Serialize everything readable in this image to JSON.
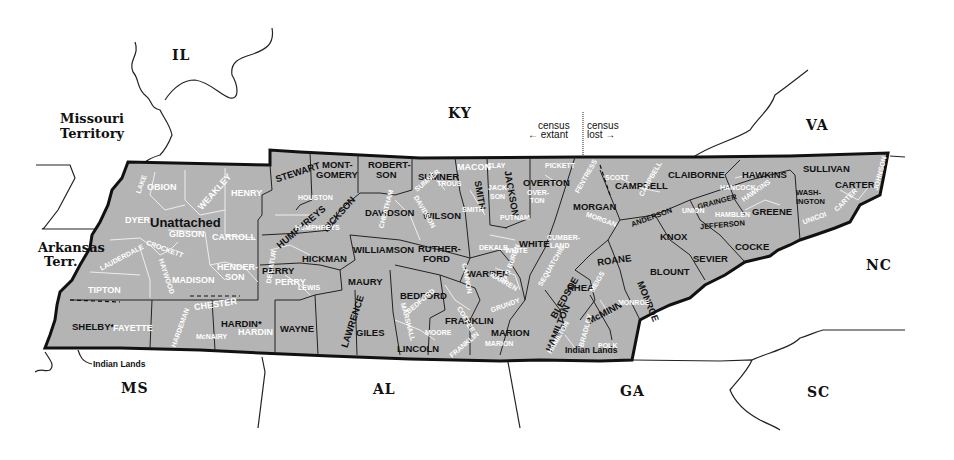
{
  "map": {
    "subject": "Tennessee counties (census map)",
    "neighbors": {
      "il": "IL",
      "missouri_1": "Missouri",
      "missouri_2": "Territory",
      "arkansas_1": "Arkansas",
      "arkansas_2": "Terr.",
      "ky": "KY",
      "va": "VA",
      "nc": "NC",
      "sc": "SC",
      "ga": "GA",
      "al": "AL",
      "ms": "MS"
    },
    "legend": {
      "left_line1": "census",
      "left_line2": "← extant",
      "right_line1": "census",
      "right_line2": "lost →"
    },
    "annotations": {
      "unattached": "Unattached",
      "indian_lands_west": "Indian Lands",
      "indian_lands_east": "Indian Lands"
    },
    "colors": {
      "state_fill": "#b4b4b4",
      "border": "#111111",
      "modern_label": "#ffffff",
      "background": "#ffffff"
    },
    "counties": {
      "obion": "OBION",
      "weakley": "WEAKLEY",
      "henry": "HENRY",
      "lake": "LAKE",
      "dyer": "DYER",
      "gibson": "GIBSON",
      "carroll": "CARROLL",
      "lauderdale": "LAUDERDALE",
      "crockett": "CROCKETT",
      "haywood": "HAYWOOD",
      "madison": "MADISON",
      "henderson_1": "HENDER-",
      "henderson_2": "SON",
      "tipton": "TIPTON",
      "shelby": "SHELBY*",
      "fayette": "FAYETTE",
      "hardeman": "HARDEMAN",
      "chester": "CHESTER",
      "mcnairy": "McNAIRY",
      "hardin_bold": "HARDIN*",
      "hardin_modern": "HARDIN",
      "decatur": "DECATUR",
      "perry": "PERRY",
      "perry_modern": "PERRY",
      "wayne": "WAYNE",
      "stewart": "STEWART",
      "houston": "HOUSTON",
      "humphreys": "HUMPHREYS",
      "humphreys_modern": "HUMPHREYS",
      "dickson": "DICKSON",
      "montgomery_1": "MONT-",
      "montgomery_2": "GOMERY",
      "robertson_1": "ROBERT-",
      "robertson_2": "SON",
      "sumner": "SUMNER",
      "sumner_modern": "SUMNER",
      "trousdale": "TROUS",
      "macon": "MACON",
      "smith": "SMITH",
      "smith_modern": "SMITH",
      "jackson": "JACKSON",
      "jackson_modern_1": "JACK-",
      "jackson_modern_2": "SON",
      "clay": "CLAY",
      "overton": "OVERTON",
      "overton_modern_1": "OVER-",
      "overton_modern_2": "TON",
      "pickett": "PICKETT",
      "fentress": "FENTRESS",
      "putnam": "PUTNAM",
      "davidson": "DAVIDSON",
      "davidson_modern": "DAVIDSON",
      "cheatham": "CHEATHAM",
      "wilson": "WILSON",
      "dekalb": "DEKALB",
      "williamson": "WILLIAMSON",
      "rutherford_1": "RUTHER-",
      "rutherford_2": "FORD",
      "cannon": "CANNON",
      "hickman": "HICKMAN",
      "maury": "MAURY",
      "lewis": "LEWIS",
      "marshall": "MARSHALL",
      "bedford": "BEDFORD",
      "bedford_modern": "BEDFORD",
      "coffee": "COFFEE",
      "warren": "WARREN",
      "warren_modern": "WARREN",
      "white": "WHITE",
      "white_modern": "WHITE",
      "van_buren": "VAN BUREN",
      "grundy": "GRUNDY",
      "lawrence": "LAWRENCE",
      "giles": "GILES",
      "lincoln": "LINCOLN",
      "moore": "MOORE",
      "franklin": "FRANKLIN",
      "franklin_modern": "FRANKLIN",
      "marion": "MARION",
      "marion_modern": "MARION",
      "sequatchie": "SEQUATCHIE",
      "bledsoe": "BLEDSOE",
      "cumberland_1": "CUMBER-",
      "cumberland_2": "LAND",
      "morgan": "MORGAN",
      "morgan_modern": "MORGAN",
      "scott": "SCOTT",
      "campbell": "CAMPBELL",
      "campbell_modern": "CAMPBELL",
      "claiborne": "CLAIBORNE",
      "union": "UNION",
      "anderson": "ANDERSON",
      "roane": "ROANE",
      "rhea": "RHEA",
      "meigs": "MEIGS",
      "hamilton": "HAMILTON",
      "hamilton_modern": "HAMILTON",
      "bradley": "BRADLEY",
      "mcminn": "McMINN",
      "monroe": "MONROE",
      "monroe_modern": "MONROE",
      "polk": "POLK",
      "knox": "KNOX",
      "blount": "BLOUNT",
      "sevier": "SEVIER",
      "grainger": "GRAINGER",
      "jefferson": "JEFFERSON",
      "hamblen": "HAMBLEN",
      "cocke": "COCKE",
      "hawkins": "HAWKINS",
      "hawkins_modern": "HAWKINS",
      "hancock": "HANCOCK",
      "greene": "GREENE",
      "sullivan": "SULLIVAN",
      "washington_1": "WASH-",
      "washington_2": "INGTON",
      "unicoi": "UNICOI",
      "carter": "CARTER",
      "carter_modern": "CARTER",
      "johnson": "JOHNSON"
    }
  }
}
